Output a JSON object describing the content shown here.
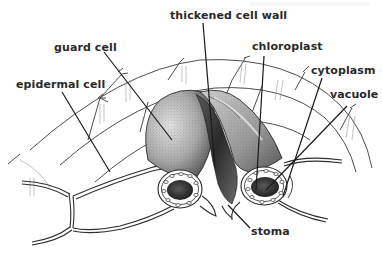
{
  "diagram": {
    "labels": {
      "thickened_cell_wall": "thickened cell wall",
      "guard_cell": "guard cell",
      "epidermal_cell": "epidermal cell",
      "chloroplast": "chloroplast",
      "cytoplasm": "cytoplasm",
      "vacuole": "vacuole",
      "stoma": "stoma"
    },
    "label_items": [
      {
        "key": "thickened_cell_wall",
        "text": "thickened cell wall",
        "x": 170,
        "y": 19,
        "line": [
          203,
          23,
          215,
          168
        ]
      },
      {
        "key": "guard_cell",
        "text": "guard cell",
        "x": 54,
        "y": 51,
        "line": [
          104,
          52,
          172,
          140
        ]
      },
      {
        "key": "epidermal_cell",
        "text": "epidermal cell",
        "x": 16,
        "y": 88,
        "line": [
          62,
          92,
          110,
          172
        ]
      },
      {
        "key": "chloroplast",
        "text": "chloroplast",
        "x": 252,
        "y": 50,
        "line": [
          264,
          56,
          256,
          190
        ]
      },
      {
        "key": "cytoplasm",
        "text": "cytoplasm",
        "x": 311,
        "y": 74,
        "line": [
          322,
          78,
          283,
          196
        ]
      },
      {
        "key": "vacuole",
        "text": "vacuole",
        "x": 330,
        "y": 98,
        "line": [
          347,
          106,
          266,
          190
        ]
      },
      {
        "key": "stoma",
        "text": "stoma",
        "x": 251,
        "y": 235,
        "line": [
          250,
          228,
          228,
          205
        ]
      }
    ],
    "colors": {
      "background": "#ffffff",
      "ink": "#1a1a1a",
      "label_text": "#2a2a2a",
      "stipple_dark": "#3c3c3c",
      "stipple_mid": "#8a8a8a",
      "stipple_light": "#c8c8c8"
    }
  }
}
